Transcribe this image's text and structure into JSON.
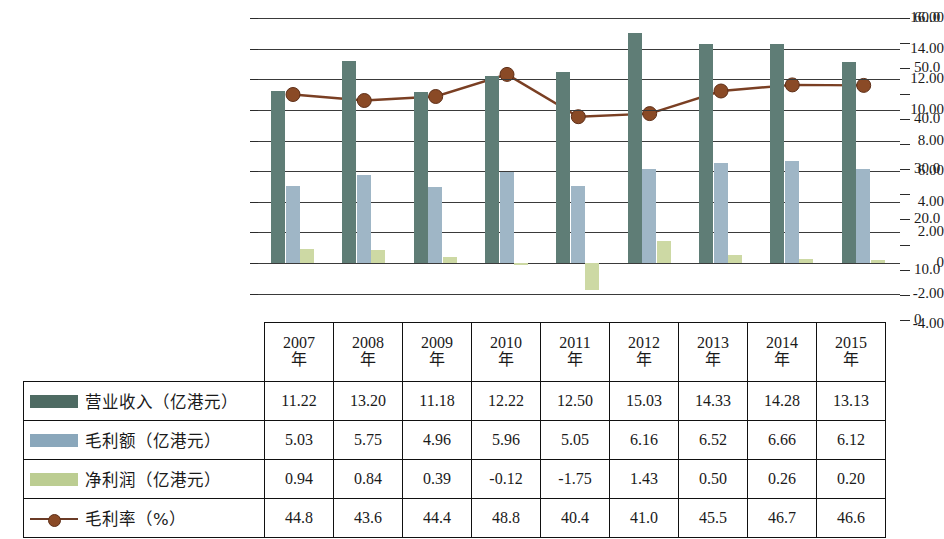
{
  "chart_data": {
    "type": "bar",
    "title": "",
    "subtitle": "",
    "xlabel": "",
    "ylabel": "",
    "categories": [
      "2007年",
      "2008年",
      "2009年",
      "2010年",
      "2011年",
      "2012年",
      "2013年",
      "2014年",
      "2015年"
    ],
    "left_axis": {
      "ylabel": "",
      "ylim": [
        -4.0,
        16.0
      ],
      "ticks": [
        16.0,
        14.0,
        12.0,
        10.0,
        8.0,
        6.0,
        4.0,
        2.0,
        0,
        -2.0,
        -4.0
      ],
      "tick_labels": [
        "16.00",
        "14.00",
        "12.00",
        "10.00",
        "8.00",
        "6.00",
        "4.00",
        "2.00",
        "0",
        "-2.00",
        "-4.00"
      ],
      "grid": true
    },
    "right_axis": {
      "ylabel": "",
      "ylim": [
        0,
        60.0
      ],
      "ticks": [
        60.0,
        55.0,
        50.0,
        45.0,
        40.0,
        35.0,
        30.0,
        25.0,
        20.0,
        15.0,
        10.0,
        5.0,
        0
      ],
      "tick_labels": [
        "60.0",
        "",
        "50.0",
        "",
        "40.0",
        "",
        "30.0",
        "",
        "20.0",
        "",
        "10.0",
        "",
        "0"
      ],
      "grid": false
    },
    "legend_position": "table-left",
    "series": [
      {
        "name": "营业收入（亿港元）",
        "type": "bar",
        "axis": "left",
        "color": "#5f7d76",
        "values": [
          11.22,
          13.2,
          11.18,
          12.22,
          12.5,
          15.03,
          14.33,
          14.28,
          13.13
        ]
      },
      {
        "name": "毛利额（亿港元）",
        "type": "bar",
        "axis": "left",
        "color": "#9fb6c6",
        "values": [
          5.03,
          5.75,
          4.96,
          5.96,
          5.05,
          6.16,
          6.52,
          6.66,
          6.12
        ]
      },
      {
        "name": "净利润（亿港元）",
        "type": "bar",
        "axis": "left",
        "color": "#cdd9a4",
        "values": [
          0.94,
          0.84,
          0.39,
          -0.12,
          -1.75,
          1.43,
          0.5,
          0.26,
          0.2
        ]
      },
      {
        "name": "毛利率（%）",
        "type": "line",
        "axis": "right",
        "color": "#7a3f23",
        "marker_color": "#8a4a26",
        "values": [
          44.8,
          43.6,
          44.4,
          48.8,
          40.4,
          41.0,
          45.5,
          46.7,
          46.6
        ]
      }
    ]
  },
  "table": {
    "corner_label": "",
    "year_headers": [
      {
        "year": "2007",
        "unit": "年"
      },
      {
        "year": "2008",
        "unit": "年"
      },
      {
        "year": "2009",
        "unit": "年"
      },
      {
        "year": "2010",
        "unit": "年"
      },
      {
        "year": "2011",
        "unit": "年"
      },
      {
        "year": "2012",
        "unit": "年"
      },
      {
        "year": "2013",
        "unit": "年"
      },
      {
        "year": "2014",
        "unit": "年"
      },
      {
        "year": "2015",
        "unit": "年"
      }
    ],
    "rows": [
      {
        "label": "营业收入（亿港元）",
        "swatch": "bar-swatch-revenue",
        "values": [
          "11.22",
          "13.20",
          "11.18",
          "12.22",
          "12.50",
          "15.03",
          "14.33",
          "14.28",
          "13.13"
        ]
      },
      {
        "label": "毛利额（亿港元）",
        "swatch": "bar-swatch-gross-profit",
        "values": [
          "5.03",
          "5.75",
          "4.96",
          "5.96",
          "5.05",
          "6.16",
          "6.52",
          "6.66",
          "6.12"
        ]
      },
      {
        "label": "净利润（亿港元）",
        "swatch": "bar-swatch-net-profit",
        "values": [
          "0.94",
          "0.84",
          "0.39",
          "-0.12",
          "-1.75",
          "1.43",
          "0.50",
          "0.26",
          "0.20"
        ]
      },
      {
        "label": "毛利率（%）",
        "swatch": "line-swatch-gross-margin",
        "values": [
          "44.8",
          "43.6",
          "44.4",
          "48.8",
          "40.4",
          "41.0",
          "45.5",
          "46.7",
          "46.6"
        ]
      }
    ]
  },
  "axis_left_labels": [
    "16.00",
    "14.00",
    "12.00",
    "10.00",
    "8.00",
    "6.00",
    "4.00",
    "2.00",
    "0",
    "-2.00",
    "-4.00"
  ],
  "axis_right_labels": [
    "60.0",
    "50.0",
    "40.0",
    "30.0",
    "20.0",
    "10.0",
    "0"
  ]
}
